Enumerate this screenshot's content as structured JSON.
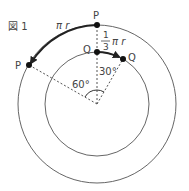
{
  "figure": {
    "title": "図 1",
    "labels": {
      "outer_top_point": "P",
      "outer_left_point": "P",
      "inner_top_point": "Q",
      "inner_right_point": "Q",
      "outer_arc": "π r",
      "inner_arc_fraction_num": "1",
      "inner_arc_fraction_den": "3",
      "inner_arc_rest": "π r",
      "angle_outer": "60°",
      "angle_inner": "30°"
    },
    "colors": {
      "stroke": "#555555",
      "arrow": "#222222",
      "text": "#444444"
    }
  }
}
